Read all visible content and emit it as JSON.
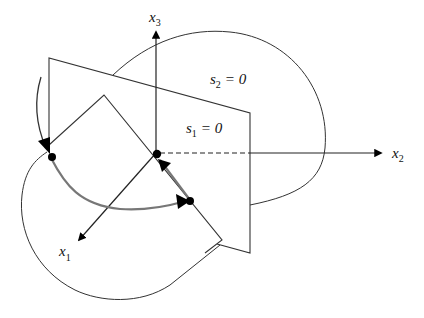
{
  "figure": {
    "type": "sliding-surface-phase-diagram",
    "axes": {
      "x1": {
        "base": "x",
        "sub": "1"
      },
      "x2": {
        "base": "x",
        "sub": "2"
      },
      "x3": {
        "base": "x",
        "sub": "3"
      }
    },
    "surfaces": {
      "s1": {
        "base": "s",
        "sub": "1",
        "rhs": "= 0"
      },
      "s2": {
        "base": "s",
        "sub": "2",
        "rhs": "= 0"
      }
    },
    "colors": {
      "line": "#333333",
      "trajectory": "#777777",
      "marker": "#000000",
      "background": "#ffffff"
    }
  }
}
